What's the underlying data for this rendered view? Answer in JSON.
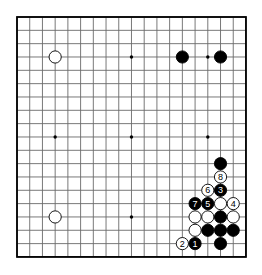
{
  "board": {
    "size": 19,
    "origin_x": 17,
    "origin_y": 17,
    "spacing_x": 12.72,
    "spacing_y": 13.33,
    "line_color": "#6a6a6a",
    "border_color": "#000000",
    "background": "#ffffff",
    "star_points": [
      [
        3,
        3
      ],
      [
        9,
        3
      ],
      [
        15,
        3
      ],
      [
        3,
        9
      ],
      [
        9,
        9
      ],
      [
        15,
        9
      ],
      [
        3,
        15
      ],
      [
        9,
        15
      ],
      [
        15,
        15
      ]
    ]
  },
  "stones": [
    {
      "color": "white",
      "col": 3,
      "row": 3,
      "label": ""
    },
    {
      "color": "black",
      "col": 13,
      "row": 3,
      "label": ""
    },
    {
      "color": "black",
      "col": 16,
      "row": 3,
      "label": ""
    },
    {
      "color": "white",
      "col": 3,
      "row": 15,
      "label": ""
    },
    {
      "color": "black",
      "col": 16,
      "row": 11,
      "label": ""
    },
    {
      "color": "white",
      "col": 16,
      "row": 12,
      "label": "8"
    },
    {
      "color": "white",
      "col": 15,
      "row": 13,
      "label": "6"
    },
    {
      "color": "black",
      "col": 16,
      "row": 13,
      "label": "3"
    },
    {
      "color": "black",
      "col": 14,
      "row": 14,
      "label": "7"
    },
    {
      "color": "black",
      "col": 15,
      "row": 14,
      "label": "5"
    },
    {
      "color": "white",
      "col": 16,
      "row": 14,
      "label": ""
    },
    {
      "color": "white",
      "col": 17,
      "row": 14,
      "label": "4"
    },
    {
      "color": "white",
      "col": 14,
      "row": 15,
      "label": ""
    },
    {
      "color": "white",
      "col": 15,
      "row": 15,
      "label": ""
    },
    {
      "color": "black",
      "col": 16,
      "row": 15,
      "label": ""
    },
    {
      "color": "white",
      "col": 17,
      "row": 15,
      "label": ""
    },
    {
      "color": "white",
      "col": 14,
      "row": 16,
      "label": ""
    },
    {
      "color": "black",
      "col": 15,
      "row": 16,
      "label": ""
    },
    {
      "color": "black",
      "col": 16,
      "row": 16,
      "label": ""
    },
    {
      "color": "black",
      "col": 17,
      "row": 16,
      "label": ""
    },
    {
      "color": "white",
      "col": 13,
      "row": 17,
      "label": "2"
    },
    {
      "color": "black",
      "col": 14,
      "row": 17,
      "label": "1"
    },
    {
      "color": "black",
      "col": 16,
      "row": 17,
      "label": ""
    }
  ]
}
